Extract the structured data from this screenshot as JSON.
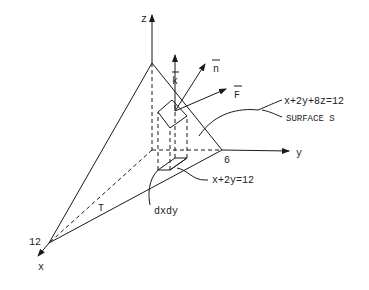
{
  "figure": {
    "axes": {
      "x": {
        "label": "x",
        "intercept_label": "12"
      },
      "y": {
        "label": "y",
        "intercept_label": "6"
      },
      "z": {
        "label": "z"
      }
    },
    "vectors": {
      "k": "k",
      "n": "n",
      "F": "F"
    },
    "labels": {
      "surface_equation": "x+2y+8z=12",
      "surface_name": "SURFACE S",
      "trace_equation": "x+2y=12",
      "region": "T",
      "area_element": "dxdy"
    }
  }
}
